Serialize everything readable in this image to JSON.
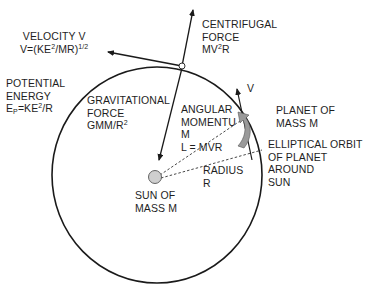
{
  "diagram": {
    "type": "planetary-orbit-physics",
    "colors": {
      "background": "#ffffff",
      "line": "#1a1a1a",
      "sun_fill": "#cfcfcf",
      "angular_arrow_fill": "#9a9a9a"
    },
    "labels": {
      "velocity": {
        "line1": "VELOCITY V",
        "line2_prefix": "V=(KE",
        "line2_sup1": "2",
        "line2_mid": "/MR)",
        "line2_sup2": "1/2"
      },
      "centrifugal": {
        "line1": "CENTRIFUGAL",
        "line2": "FORCE",
        "line3_prefix": "MV",
        "line3_sup": "2",
        "line3_suffix": "R"
      },
      "potential": {
        "line1": "POTENTIAL",
        "line2": "ENERGY",
        "line3_e": "E",
        "line3_sub": "P",
        "line3_mid": "=KE",
        "line3_sup": "2",
        "line3_suffix": "/R"
      },
      "gravitational": {
        "line1": "GRAVITATIONAL",
        "line2": "FORCE",
        "line3_prefix": "GMM/R",
        "line3_sup": "2"
      },
      "angular": {
        "line1": "ANGULAR",
        "line2": "MOMENTU",
        "line3": "M",
        "line4": "L = MVR"
      },
      "v_tangent": "V",
      "planet": {
        "line1": "PLANET OF",
        "line2": "MASS M"
      },
      "orbit": {
        "line1": "ELLIPTICAL ORBIT",
        "line2": "OF PLANET",
        "line3": "AROUND",
        "line4": "SUN"
      },
      "radius": {
        "line1": "RADIUS",
        "line2": "R"
      },
      "sun": {
        "line1": "SUN OF",
        "line2": "MASS M"
      }
    }
  }
}
